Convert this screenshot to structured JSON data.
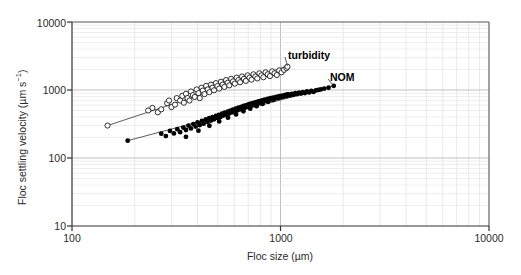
{
  "chart_data": {
    "type": "scatter",
    "title": "",
    "xlabel": "Floc size (µm)",
    "ylabel": "Floc settling velocity (µm s⁻¹)",
    "xscale": "log",
    "yscale": "log",
    "xlim": [
      100,
      10000
    ],
    "ylim": [
      10,
      10000
    ],
    "xticks": [
      100,
      1000,
      10000
    ],
    "xtick_labels": [
      "100",
      "1000",
      "10000"
    ],
    "yticks": [
      10,
      100,
      1000,
      10000
    ],
    "ytick_labels": [
      "10",
      "100",
      "1000",
      "10000"
    ],
    "grid": true,
    "grid_minor": true,
    "legend_position": "inline-annotations",
    "series": [
      {
        "name": "turbidity",
        "marker": "open-circle",
        "color": "#1a1a1a",
        "annotation": "turbidity",
        "annotation_xy": [
          1150,
          1950
        ],
        "fit_line": {
          "x": [
            148,
            1080
          ],
          "y": [
            300,
            2250
          ]
        },
        "points": [
          [
            148,
            300
          ],
          [
            232,
            500
          ],
          [
            243,
            545
          ],
          [
            258,
            470
          ],
          [
            268,
            520
          ],
          [
            286,
            640
          ],
          [
            292,
            700
          ],
          [
            300,
            560
          ],
          [
            312,
            610
          ],
          [
            318,
            760
          ],
          [
            330,
            700
          ],
          [
            338,
            820
          ],
          [
            344,
            650
          ],
          [
            352,
            880
          ],
          [
            358,
            760
          ],
          [
            366,
            700
          ],
          [
            372,
            950
          ],
          [
            380,
            840
          ],
          [
            388,
            790
          ],
          [
            396,
            1020
          ],
          [
            404,
            900
          ],
          [
            410,
            760
          ],
          [
            418,
            1080
          ],
          [
            424,
            980
          ],
          [
            432,
            870
          ],
          [
            440,
            1150
          ],
          [
            448,
            1020
          ],
          [
            456,
            930
          ],
          [
            464,
            1200
          ],
          [
            472,
            1080
          ],
          [
            480,
            990
          ],
          [
            490,
            1260
          ],
          [
            498,
            1140
          ],
          [
            508,
            1050
          ],
          [
            518,
            1320
          ],
          [
            528,
            1200
          ],
          [
            538,
            1110
          ],
          [
            548,
            1400
          ],
          [
            558,
            1280
          ],
          [
            568,
            1170
          ],
          [
            580,
            1460
          ],
          [
            592,
            1340
          ],
          [
            604,
            1240
          ],
          [
            616,
            1520
          ],
          [
            628,
            1400
          ],
          [
            640,
            1300
          ],
          [
            654,
            1580
          ],
          [
            668,
            1460
          ],
          [
            682,
            1360
          ],
          [
            696,
            1640
          ],
          [
            710,
            1520
          ],
          [
            726,
            1420
          ],
          [
            742,
            1700
          ],
          [
            758,
            1580
          ],
          [
            774,
            1480
          ],
          [
            792,
            1760
          ],
          [
            810,
            1640
          ],
          [
            828,
            1540
          ],
          [
            848,
            1820
          ],
          [
            868,
            1700
          ],
          [
            890,
            1600
          ],
          [
            912,
            1880
          ],
          [
            936,
            1760
          ],
          [
            960,
            1660
          ],
          [
            986,
            1940
          ],
          [
            1012,
            1820
          ],
          [
            1040,
            1980
          ],
          [
            1068,
            2100
          ],
          [
            1080,
            2200
          ]
        ]
      },
      {
        "name": "NOM",
        "marker": "filled-circle",
        "color": "#000000",
        "annotation": "NOM",
        "annotation_xy": [
          1700,
          1100
        ],
        "fit_line": {
          "x": [
            185,
            1800
          ],
          "y": [
            180,
            1150
          ]
        },
        "points": [
          [
            185,
            180
          ],
          [
            268,
            228
          ],
          [
            282,
            210
          ],
          [
            295,
            250
          ],
          [
            308,
            230
          ],
          [
            320,
            265
          ],
          [
            330,
            240
          ],
          [
            342,
            280
          ],
          [
            352,
            258
          ],
          [
            362,
            300
          ],
          [
            372,
            272
          ],
          [
            382,
            315
          ],
          [
            392,
            290
          ],
          [
            400,
            335
          ],
          [
            410,
            305
          ],
          [
            420,
            350
          ],
          [
            428,
            320
          ],
          [
            438,
            368
          ],
          [
            446,
            340
          ],
          [
            455,
            385
          ],
          [
            464,
            355
          ],
          [
            472,
            400
          ],
          [
            480,
            370
          ],
          [
            490,
            415
          ],
          [
            498,
            388
          ],
          [
            506,
            432
          ],
          [
            515,
            400
          ],
          [
            524,
            448
          ],
          [
            532,
            420
          ],
          [
            540,
            465
          ],
          [
            548,
            435
          ],
          [
            558,
            480
          ],
          [
            566,
            450
          ],
          [
            575,
            498
          ],
          [
            584,
            468
          ],
          [
            592,
            515
          ],
          [
            602,
            485
          ],
          [
            610,
            532
          ],
          [
            620,
            500
          ],
          [
            628,
            548
          ],
          [
            638,
            518
          ],
          [
            648,
            565
          ],
          [
            656,
            535
          ],
          [
            666,
            582
          ],
          [
            676,
            552
          ],
          [
            686,
            600
          ],
          [
            696,
            568
          ],
          [
            706,
            618
          ],
          [
            716,
            588
          ],
          [
            726,
            635
          ],
          [
            736,
            605
          ],
          [
            748,
            652
          ],
          [
            758,
            622
          ],
          [
            770,
            670
          ],
          [
            780,
            640
          ],
          [
            792,
            688
          ],
          [
            804,
            658
          ],
          [
            816,
            705
          ],
          [
            828,
            675
          ],
          [
            840,
            722
          ],
          [
            852,
            692
          ],
          [
            866,
            740
          ],
          [
            880,
            710
          ],
          [
            894,
            758
          ],
          [
            908,
            728
          ],
          [
            922,
            775
          ],
          [
            938,
            745
          ],
          [
            952,
            792
          ],
          [
            968,
            762
          ],
          [
            984,
            810
          ],
          [
            1000,
            780
          ],
          [
            1018,
            828
          ],
          [
            1035,
            798
          ],
          [
            1054,
            845
          ],
          [
            1072,
            815
          ],
          [
            1092,
            862
          ],
          [
            1112,
            832
          ],
          [
            1134,
            880
          ],
          [
            1155,
            850
          ],
          [
            1178,
            898
          ],
          [
            1202,
            868
          ],
          [
            1228,
            915
          ],
          [
            1254,
            885
          ],
          [
            1282,
            932
          ],
          [
            1310,
            902
          ],
          [
            1340,
            950
          ],
          [
            1372,
            920
          ],
          [
            1405,
            968
          ],
          [
            1440,
            938
          ],
          [
            1478,
            985
          ],
          [
            1518,
            1002
          ],
          [
            1560,
            1020
          ],
          [
            1620,
            1048
          ],
          [
            1700,
            1080
          ],
          [
            1800,
            1150
          ],
          [
            352,
            205
          ],
          [
            404,
            252
          ],
          [
            456,
            298
          ],
          [
            508,
            345
          ],
          [
            560,
            392
          ],
          [
            612,
            438
          ],
          [
            664,
            485
          ],
          [
            716,
            532
          ],
          [
            768,
            578
          ],
          [
            820,
            625
          ],
          [
            872,
            672
          ],
          [
            924,
            718
          ],
          [
            976,
            765
          ],
          [
            1028,
            812
          ],
          [
            1080,
            858
          ]
        ]
      }
    ]
  },
  "axes": {
    "x_title": "Floc size (µm)",
    "y_title_main": "Floc settling velocity (µm s",
    "y_title_sup": "−1",
    "y_title_tail": ")"
  }
}
